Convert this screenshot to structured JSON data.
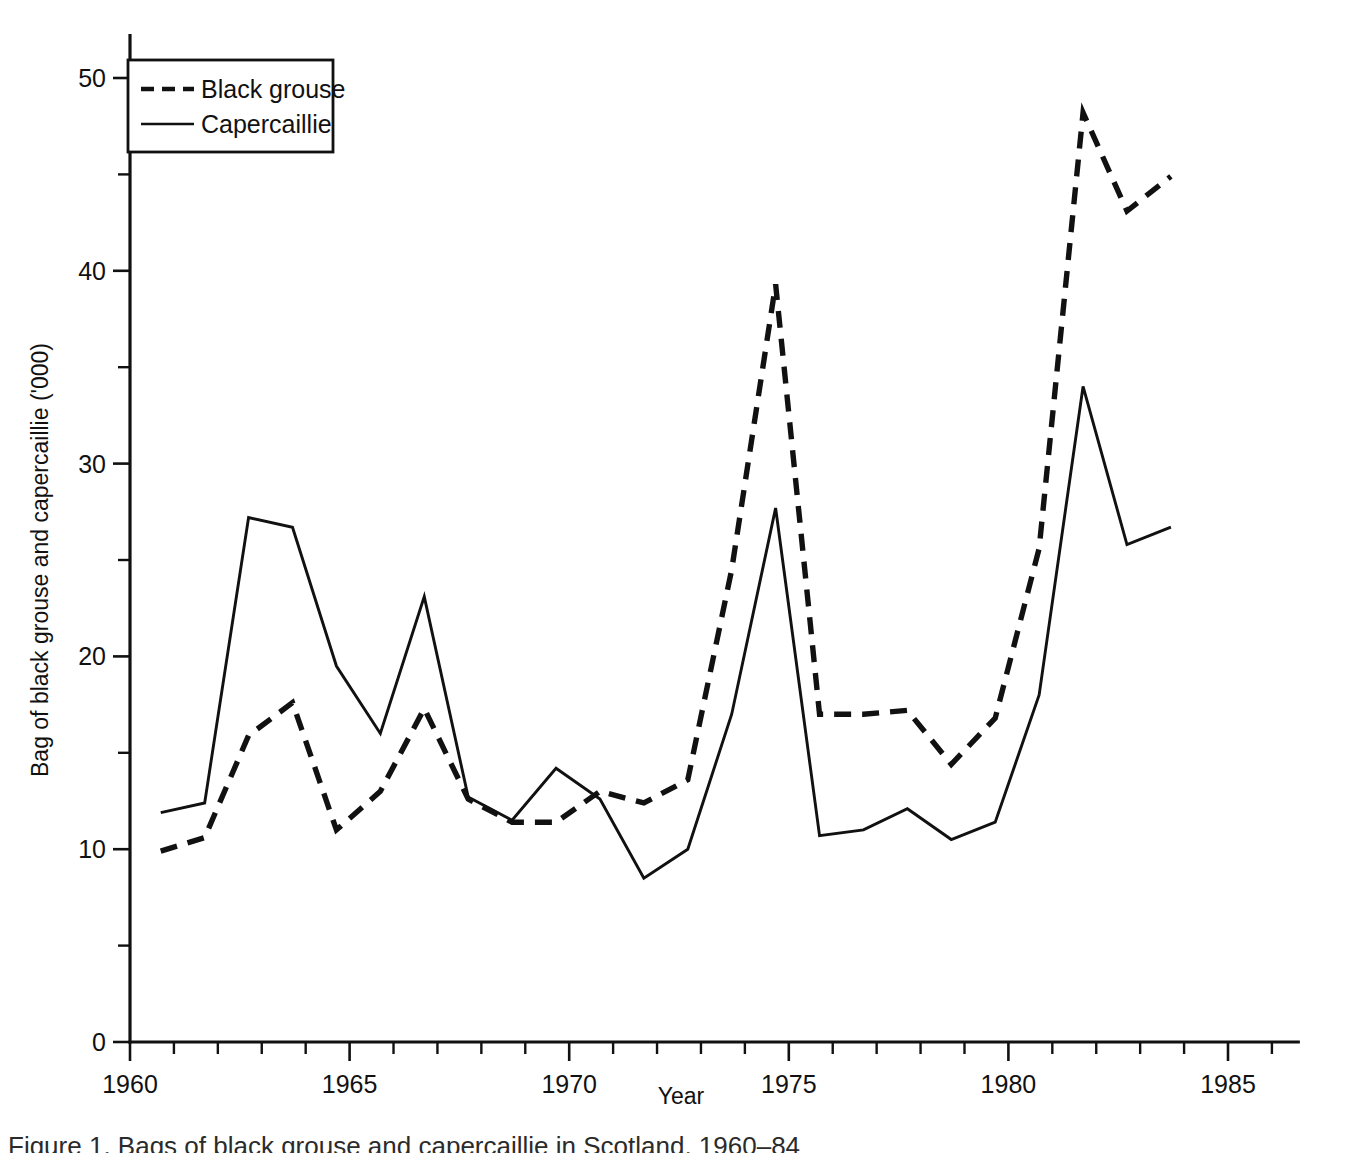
{
  "figure": {
    "background": "#ffffff",
    "ink_color": "#111111"
  },
  "axes": {
    "x_label": "Year",
    "y_label": "Bag of black grouse and capercaillie ('000)",
    "x_ticklabels": [
      "1960",
      "1965",
      "1970",
      "1975",
      "1980",
      "1985"
    ],
    "y_ticklabels": [
      "0",
      "10",
      "20",
      "30",
      "40",
      "50"
    ]
  },
  "legend": {
    "entries": [
      {
        "label": "Black grouse",
        "style": "dashed"
      },
      {
        "label": "Capercaillie",
        "style": "solid"
      }
    ]
  },
  "caption": {
    "text": "Figure 1. Bags of black grouse and capercaillie in Scotland, 1960–84"
  },
  "chart_data": {
    "type": "line",
    "title": "",
    "xlabel": "Year",
    "ylabel": "Bag of black grouse and capercaillie ('000)",
    "xlim": [
      1959.2,
      1986.6
    ],
    "ylim": [
      0,
      52
    ],
    "xticks": [
      1960,
      1965,
      1970,
      1975,
      1980,
      1985
    ],
    "xticks_minor_step": 1,
    "yticks": [
      0,
      10,
      20,
      30,
      40,
      50
    ],
    "yticks_minor": [
      5,
      15,
      25,
      35,
      45
    ],
    "grid": false,
    "legend_position": "upper-left",
    "x": [
      1960.7,
      1961.7,
      1962.7,
      1963.7,
      1964.7,
      1965.7,
      1966.7,
      1967.7,
      1968.7,
      1969.7,
      1970.7,
      1971.7,
      1972.7,
      1973.7,
      1974.7,
      1975.7,
      1976.7,
      1977.7,
      1978.7,
      1979.7,
      1980.7,
      1981.7,
      1982.7,
      1983.7
    ],
    "series": [
      {
        "name": "Black grouse",
        "style": "dashed",
        "values": [
          9.9,
          10.6,
          15.9,
          17.6,
          11.0,
          13.0,
          17.3,
          12.6,
          11.4,
          11.4,
          13.0,
          12.4,
          13.6,
          24.5,
          39.3,
          17.0,
          17.0,
          17.2,
          14.4,
          16.8,
          25.6,
          48.2,
          43.1,
          44.9
        ]
      },
      {
        "name": "Capercaillie",
        "style": "solid",
        "values": [
          11.9,
          12.4,
          27.2,
          26.7,
          19.5,
          16.0,
          23.1,
          12.7,
          11.5,
          14.2,
          12.6,
          8.5,
          10.0,
          17.0,
          27.7,
          10.7,
          11.0,
          12.1,
          10.5,
          11.4,
          18.0,
          34.0,
          25.8,
          26.7
        ]
      }
    ]
  }
}
